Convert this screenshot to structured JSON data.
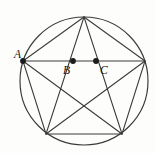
{
  "figure": {
    "type": "geometric-diagram",
    "background_color": "#fdfdfc",
    "stroke_color": "#3a3a3a",
    "dot_color": "#1c1c1c",
    "label_color": "#141414"
  },
  "circle": {
    "cx": 84,
    "cy": 81,
    "r": 64
  },
  "vertices": [
    {
      "id": "V_top",
      "x": 84,
      "y": 17,
      "label": ""
    },
    {
      "id": "V_right",
      "x": 145,
      "y": 61,
      "label": ""
    },
    {
      "id": "V_bottom_right",
      "x": 122,
      "y": 134,
      "label": ""
    },
    {
      "id": "V_bottom_left",
      "x": 46,
      "y": 134,
      "label": ""
    },
    {
      "id": "V_left",
      "x": 23,
      "y": 61,
      "label": "A"
    }
  ],
  "marked_points": [
    {
      "id": "A",
      "label": "A",
      "x": 23,
      "y": 61,
      "label_x": 14,
      "label_y": 58,
      "dot": true
    },
    {
      "id": "B",
      "label": "B",
      "x": 73,
      "y": 61,
      "label_x": 63,
      "label_y": 74,
      "dot": true
    },
    {
      "id": "C",
      "label": "C",
      "x": 96,
      "y": 61,
      "label_x": 100,
      "label_y": 74,
      "dot": true
    }
  ],
  "pentagon_edges": [
    {
      "from": "V_top",
      "to": "V_right"
    },
    {
      "from": "V_right",
      "to": "V_bottom_right"
    },
    {
      "from": "V_bottom_right",
      "to": "V_bottom_left"
    },
    {
      "from": "V_bottom_left",
      "to": "V_left"
    },
    {
      "from": "V_left",
      "to": "V_top"
    }
  ],
  "pentagram_edges": [
    {
      "from": "V_top",
      "to": "V_bottom_right"
    },
    {
      "from": "V_bottom_right",
      "to": "V_left"
    },
    {
      "from": "V_left",
      "to": "V_right"
    },
    {
      "from": "V_right",
      "to": "V_bottom_left"
    },
    {
      "from": "V_bottom_left",
      "to": "V_top"
    }
  ],
  "labels": {
    "a": "A",
    "b": "B",
    "c": "C"
  }
}
